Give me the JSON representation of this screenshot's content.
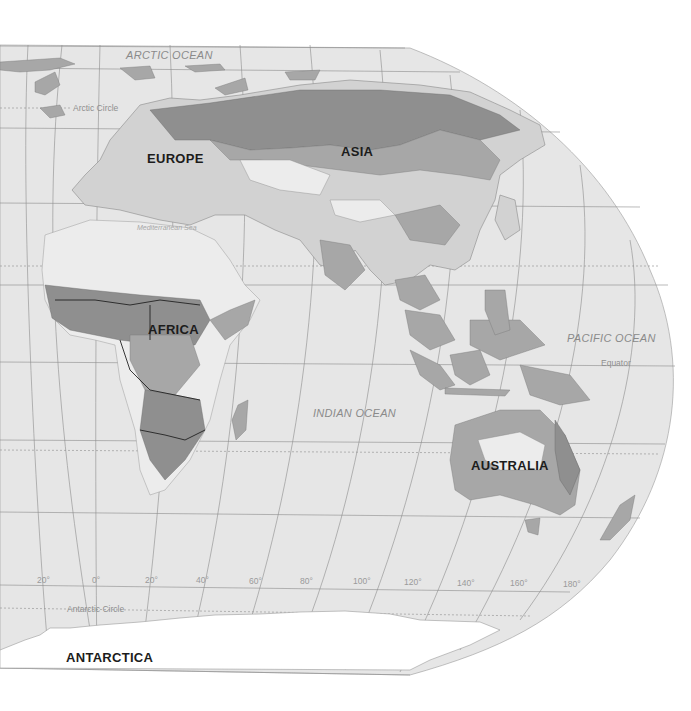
{
  "map": {
    "title": "",
    "colors": {
      "ocean": "#e6e6e6",
      "background": "#ffffff",
      "land_light": "#d2d2d2",
      "land_mid": "#a7a7a7",
      "land_dark": "#8f8f8f",
      "graticule": "#8c8c8c"
    },
    "oceans": {
      "arctic": "ARCTIC OCEAN",
      "indian": "INDIAN OCEAN",
      "pacific": "PACIFIC OCEAN"
    },
    "continents": {
      "europe": "EUROPE",
      "asia": "ASIA",
      "africa": "AFRICA",
      "australia": "AUSTRALIA",
      "antarctica": "ANTARCTICA"
    },
    "seas": {
      "mediterranean": "Mediterranean Sea"
    },
    "lines": {
      "arctic_circle": "Arctic Circle",
      "equator": "Equator",
      "antarctic_circle": "Antarctic Circle"
    },
    "longitudes": [
      "20°",
      "0°",
      "20°",
      "40°",
      "60°",
      "80°",
      "100°",
      "120°",
      "140°",
      "160°",
      "180°"
    ]
  }
}
